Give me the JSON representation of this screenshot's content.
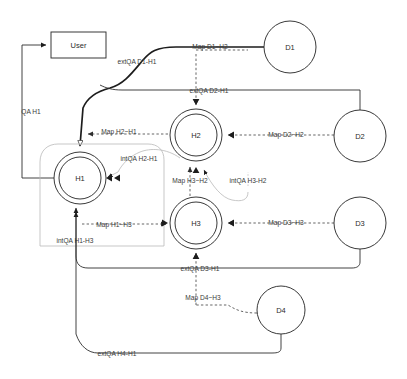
{
  "diagram": {
    "background_color": "#ffffff",
    "line_color": "#2e2e2e",
    "dashed_line_color": "#4a4a4a",
    "nodes": [
      {
        "id": "user",
        "label": "User",
        "shape": "rectangle",
        "x": 78,
        "y": 45,
        "w": 55,
        "h": 26
      },
      {
        "id": "d1",
        "label": "D1",
        "shape": "circle",
        "x": 290,
        "y": 47,
        "r": 26
      },
      {
        "id": "d2",
        "label": "D2",
        "shape": "circle",
        "x": 360,
        "y": 136,
        "r": 26
      },
      {
        "id": "d3",
        "label": "D3",
        "shape": "circle",
        "x": 360,
        "y": 223,
        "r": 26
      },
      {
        "id": "d4",
        "label": "D4",
        "shape": "circle",
        "x": 281,
        "y": 310,
        "r": 24
      },
      {
        "id": "h1",
        "label": "H1",
        "shape": "double-circle",
        "x": 80,
        "y": 178,
        "r": 26,
        "r_inner": 21
      },
      {
        "id": "h2",
        "label": "H2",
        "shape": "double-circle",
        "x": 196,
        "y": 135,
        "r": 26,
        "r_inner": 21
      },
      {
        "id": "h3",
        "label": "H3",
        "shape": "double-circle",
        "x": 196,
        "y": 223,
        "r": 26,
        "r_inner": 21
      }
    ],
    "edges": [
      {
        "id": "qa-h1",
        "label": "QA H1",
        "style": "solid",
        "from": "h1",
        "to": "user"
      },
      {
        "id": "extqa-d1-h1",
        "label": "extQA D1-H1",
        "style": "solid",
        "from": "d1",
        "to": "h1"
      },
      {
        "id": "map-d1-h2",
        "label": "Map D1~H2",
        "style": "dashed",
        "from": "d1",
        "to": "h2"
      },
      {
        "id": "extqa-d2-h1",
        "label": "extQA D2-H1",
        "style": "solid",
        "from": "d2",
        "to": "h2"
      },
      {
        "id": "map-d2-h2",
        "label": "Map D2~H2",
        "style": "dashed",
        "from": "d2",
        "to": "h2"
      },
      {
        "id": "map-h2-h1",
        "label": "Map H2~H1",
        "style": "dashed",
        "from": "h2",
        "to": "h1"
      },
      {
        "id": "intqa-h2-h1",
        "label": "intQA H2-H1",
        "style": "faint",
        "from": "h2",
        "to": "h1"
      },
      {
        "id": "map-h3-h2",
        "label": "Map H3~H2",
        "style": "dashed",
        "from": "h3",
        "to": "h2"
      },
      {
        "id": "intqa-h3-h2",
        "label": "intQA H3-H2",
        "style": "faint",
        "from": "h3",
        "to": "h2"
      },
      {
        "id": "map-h1-h3",
        "label": "Map H1~H3",
        "style": "dashed",
        "from": "h1",
        "to": "h3"
      },
      {
        "id": "intqa-h1-h3",
        "label": "intQA H1-H3",
        "style": "faint",
        "from": "h1",
        "to": "h3"
      },
      {
        "id": "map-d3-h3",
        "label": "Map D3~H3",
        "style": "dashed",
        "from": "d3",
        "to": "h3"
      },
      {
        "id": "extqa-d3-h1",
        "label": "extQA D3-H1",
        "style": "solid",
        "from": "d3",
        "to": "h3"
      },
      {
        "id": "map-d4-h3",
        "label": "Map D4~H3",
        "style": "dashed",
        "from": "d4",
        "to": "h3"
      },
      {
        "id": "extqa-h4-h1",
        "label": "extQA H4-H1",
        "style": "solid",
        "from": "d4",
        "to": "h1"
      }
    ],
    "edge_label_positions": {
      "qa-h1": {
        "x": 31,
        "y": 111
      },
      "extqa-d1-h1": {
        "x": 137,
        "y": 61
      },
      "map-d1-h2": {
        "x": 210,
        "y": 46
      },
      "extqa-d2-h1": {
        "x": 209,
        "y": 90
      },
      "map-d2-h2": {
        "x": 286,
        "y": 134
      },
      "map-h2-h1": {
        "x": 119,
        "y": 131
      },
      "intqa-h2-h1": {
        "x": 139,
        "y": 158
      },
      "map-h3-h2": {
        "x": 190,
        "y": 180
      },
      "intqa-h3-h2": {
        "x": 248,
        "y": 180
      },
      "map-h1-h3": {
        "x": 114,
        "y": 224
      },
      "intqa-h1-h3": {
        "x": 75,
        "y": 240
      },
      "map-d3-h3": {
        "x": 286,
        "y": 222
      },
      "extqa-d3-h1": {
        "x": 200,
        "y": 268
      },
      "map-d4-h3": {
        "x": 203,
        "y": 297
      },
      "extqa-h4-h1": {
        "x": 117,
        "y": 353
      }
    }
  }
}
